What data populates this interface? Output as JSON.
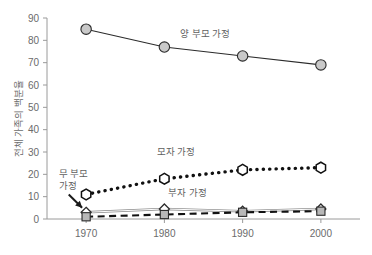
{
  "chart_data": {
    "type": "line",
    "title": "",
    "subtitle": "",
    "xlabel": "",
    "ylabel": "전체 가족의 백분율",
    "x": [
      1970,
      1980,
      1990,
      2000
    ],
    "categories": [
      "1970",
      "1980",
      "1990",
      "2000"
    ],
    "xlim": [
      1965,
      2005
    ],
    "ylim": [
      0,
      90
    ],
    "yticks": [
      0,
      10,
      20,
      30,
      40,
      50,
      60,
      70,
      80,
      90
    ],
    "ytick_labels": [
      "0",
      "10",
      "20",
      "30",
      "40",
      "50",
      "60",
      "70",
      "80",
      "90"
    ],
    "xtick_labels": [
      "1970",
      "1980",
      "1990",
      "2000"
    ],
    "grid": false,
    "legend": "inline-annotations",
    "series": [
      {
        "name": "양 부모 가정",
        "values": [
          85,
          77,
          73,
          69
        ],
        "marker": "circle",
        "marker_fill": "#c9c9c9",
        "marker_edge": "#2b2b2b",
        "line_style": "solid",
        "line_color": "#2b2b2b",
        "label_x": 1982.0,
        "label_y": 81.5
      },
      {
        "name": "모자 가정",
        "values": [
          11,
          18,
          22,
          23
        ],
        "marker": "hexagon",
        "marker_fill": "#ffffff",
        "marker_edge": "#111111",
        "line_style": "dotted",
        "line_color": "#111111",
        "label_x": 1979.0,
        "label_y": 28.5
      },
      {
        "name": "부자 가정",
        "values": [
          3,
          4.5,
          3.5,
          4.5
        ],
        "marker": "diamond",
        "marker_fill": "#ffffff",
        "marker_edge": "#2b2b2b",
        "line_style": "solid",
        "line_color": "#8d8d8d",
        "label_x": 1980.5,
        "label_y": 10.5
      },
      {
        "name": "무 부모 가정",
        "values": [
          1,
          2,
          3,
          3.5
        ],
        "marker": "square",
        "marker_fill": "#b8b8b8",
        "marker_edge": "#2b2b2b",
        "line_style": "dashed",
        "line_color": "#111111",
        "label_x": 1966.5,
        "label_y": 19.0
      }
    ],
    "annotations": [
      {
        "text": "무 부모",
        "text2": "가정",
        "target_series": "무 부모 가정",
        "target_x": 1970,
        "target_y": 1
      }
    ],
    "colors": {
      "axis": "#9a9a9a",
      "tick_text": "#6b6b6b",
      "label_text": "#5f5f5f",
      "background": "#ffffff"
    }
  }
}
